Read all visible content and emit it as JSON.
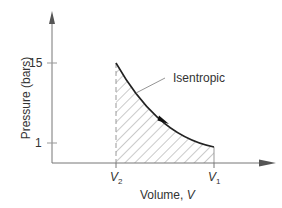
{
  "diagram": {
    "title": "",
    "curve_label": "Isentropic",
    "y_axis": {
      "label": "Pressure (bars)",
      "ticks": [
        {
          "label": "15",
          "value": 15
        },
        {
          "label": "1",
          "value": 1
        }
      ]
    },
    "x_axis": {
      "label_prefix": "Volume, ",
      "label_var": "V",
      "ticks": [
        {
          "var": "V",
          "sub": "2"
        },
        {
          "var": "V",
          "sub": "1"
        }
      ]
    },
    "colors": {
      "axis": "#777777",
      "curve": "#222222",
      "hatch": "#888888",
      "text": "#333333"
    }
  }
}
